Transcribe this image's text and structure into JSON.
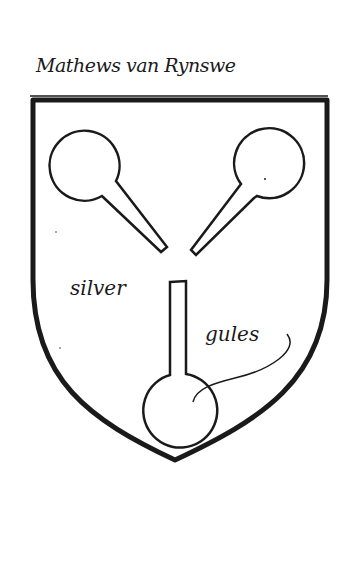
{
  "document": {
    "caption": "Mathews van Rynswe",
    "label_left": "silver",
    "label_right": "gules"
  },
  "colors": {
    "ink": "#1a1a1a",
    "paper": "#ffffff"
  },
  "shield": {
    "charges": [
      {
        "name": "upper-left-ball-and-stick",
        "type": "circle-with-handle"
      },
      {
        "name": "upper-right-ball-and-stick",
        "type": "circle-with-handle"
      },
      {
        "name": "lower-vertical-ball-and-stick",
        "type": "circle-with-handle"
      }
    ]
  }
}
